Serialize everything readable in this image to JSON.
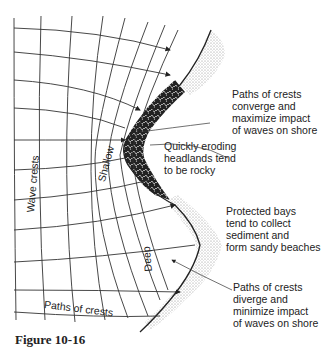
{
  "figure": {
    "caption": "Figure 10-16"
  },
  "labels": {
    "wave_crests": "Wave crests",
    "shallow": "Shallow",
    "deep": "Deep",
    "paths_of_crests": "Paths of crests"
  },
  "annotations": {
    "converge": "Paths of crests\nconverge and\nmaximize impact\nof waves on shore",
    "headlands": "Quickly eroding\nheadlands tend\nto be rocky",
    "bays": "Protected bays\ntend to collect\nsediment and\nform sandy beaches",
    "diverge": "Paths of crests\ndiverge and\nminimize impact\nof waves on shore"
  },
  "legend_semantics": {
    "rocky_headland": "dark mottled pattern",
    "sandy_beach": "light stippled pattern"
  }
}
